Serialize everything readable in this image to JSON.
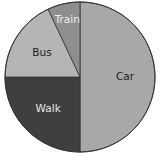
{
  "chart_data": {
    "type": "pie",
    "title": "",
    "categories": [
      "Car",
      "Walk",
      "Bus",
      "Train"
    ],
    "values": [
      50,
      25,
      18,
      7
    ],
    "unit": "%",
    "start_angle_deg": 0,
    "direction": "clockwise",
    "colors": [
      "#a8a8a8",
      "#3f3f3f",
      "#b5b5b5",
      "#8e8e8e"
    ],
    "label_colors": [
      "#222222",
      "#e8e8e8",
      "#222222",
      "#eeeeee"
    ],
    "legend": "none (labels inside slices)"
  }
}
